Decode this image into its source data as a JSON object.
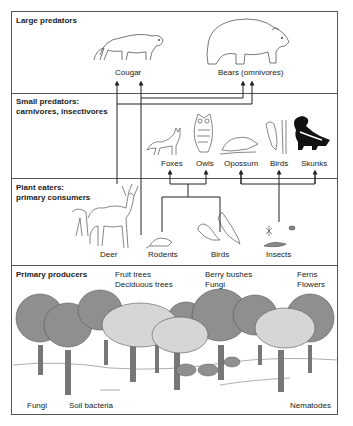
{
  "sections": [
    {
      "id": "large-predators",
      "title_lines": [
        "Large predators"
      ]
    },
    {
      "id": "small-predators",
      "title_lines": [
        "Small predators:",
        "carnivores, insectivores"
      ]
    },
    {
      "id": "plant-eaters",
      "title_lines": [
        "Plant eaters:",
        "primary consumers"
      ]
    },
    {
      "id": "primary-producers",
      "title_lines": [
        "Primary producers"
      ]
    }
  ],
  "large_predators": {
    "cougar": "Cougar",
    "bears": "Bears (omnivores)"
  },
  "small_predators": {
    "foxes": "Foxes",
    "owls": "Owls",
    "opossum": "Opossum",
    "birds": "Birds",
    "skunks": "Skunks"
  },
  "plant_eaters": {
    "deer": "Deer",
    "rodents": "Rodents",
    "birds": "Birds",
    "insects": "Insects"
  },
  "primary_producers": {
    "col1": [
      "Fruit trees",
      "Deciduous trees"
    ],
    "col2": [
      "Berry bushes",
      "Fungi"
    ],
    "col3": [
      "Ferns",
      "Flowers"
    ],
    "ground": [
      "Fungi",
      "Soil bacteria",
      "Nematodes"
    ]
  },
  "colors": {
    "line": "#222222",
    "border": "#555555",
    "tree_dark": "#8f8f8f",
    "tree_light": "#d6d6d6",
    "trunk": "#777777"
  }
}
